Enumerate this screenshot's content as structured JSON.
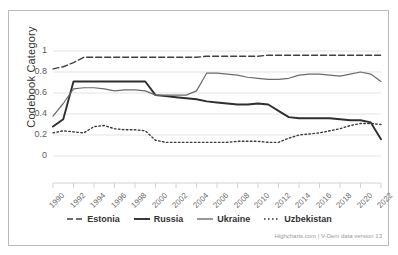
{
  "chart_data": {
    "type": "line",
    "title": "",
    "subtitle": "",
    "xlabel": "",
    "ylabel": "Codebook Category",
    "ylim": [
      0,
      1
    ],
    "xlim": [
      1990,
      2022
    ],
    "grid": true,
    "legend_position": "bottom",
    "credits": "Highcharts.com | V-Dem data version 13",
    "y_ticks": [
      "0",
      "0.2",
      "0.4",
      "0.6",
      "0.8",
      "1"
    ],
    "y_tick_values": [
      0,
      0.2,
      0.4,
      0.6,
      0.8,
      1
    ],
    "x_ticks": [
      "1990",
      "1992",
      "1994",
      "1996",
      "1998",
      "2000",
      "2002",
      "2004",
      "2006",
      "2008",
      "2010",
      "2012",
      "2014",
      "2016",
      "2018",
      "2020",
      "2022"
    ],
    "x": [
      1990,
      1991,
      1992,
      1993,
      1994,
      1995,
      1996,
      1997,
      1998,
      1999,
      2000,
      2001,
      2002,
      2003,
      2004,
      2005,
      2006,
      2007,
      2008,
      2009,
      2010,
      2011,
      2012,
      2013,
      2014,
      2015,
      2016,
      2017,
      2018,
      2019,
      2020,
      2021,
      2022
    ],
    "series": [
      {
        "name": "Estonia",
        "style": "dashed",
        "color": "#404040",
        "width": 1.4,
        "values": [
          0.83,
          0.85,
          0.89,
          0.94,
          0.94,
          0.94,
          0.94,
          0.94,
          0.94,
          0.94,
          0.94,
          0.94,
          0.94,
          0.94,
          0.94,
          0.95,
          0.95,
          0.95,
          0.95,
          0.95,
          0.95,
          0.96,
          0.96,
          0.96,
          0.96,
          0.96,
          0.96,
          0.96,
          0.96,
          0.96,
          0.96,
          0.96,
          0.96
        ]
      },
      {
        "name": "Russia",
        "style": "solid",
        "color": "#2f2f2f",
        "width": 1.9,
        "values": [
          0.28,
          0.35,
          0.71,
          0.71,
          0.71,
          0.71,
          0.71,
          0.71,
          0.71,
          0.71,
          0.58,
          0.57,
          0.56,
          0.55,
          0.54,
          0.52,
          0.51,
          0.5,
          0.49,
          0.49,
          0.5,
          0.49,
          0.43,
          0.37,
          0.36,
          0.36,
          0.36,
          0.36,
          0.35,
          0.34,
          0.34,
          0.32,
          0.16
        ]
      },
      {
        "name": "Ukraine",
        "style": "solid",
        "color": "#6b6b6b",
        "width": 1.2,
        "values": [
          0.38,
          0.5,
          0.64,
          0.65,
          0.65,
          0.64,
          0.62,
          0.63,
          0.63,
          0.62,
          0.58,
          0.58,
          0.58,
          0.58,
          0.62,
          0.79,
          0.79,
          0.78,
          0.77,
          0.75,
          0.74,
          0.73,
          0.73,
          0.74,
          0.77,
          0.78,
          0.78,
          0.77,
          0.76,
          0.78,
          0.8,
          0.78,
          0.71
        ]
      },
      {
        "name": "Uzbekistan",
        "style": "dotted",
        "color": "#3a3a3a",
        "width": 1.4,
        "values": [
          0.22,
          0.24,
          0.23,
          0.22,
          0.28,
          0.29,
          0.26,
          0.25,
          0.25,
          0.24,
          0.15,
          0.13,
          0.13,
          0.13,
          0.13,
          0.13,
          0.13,
          0.13,
          0.14,
          0.14,
          0.14,
          0.13,
          0.13,
          0.17,
          0.2,
          0.21,
          0.22,
          0.24,
          0.26,
          0.29,
          0.31,
          0.31,
          0.3
        ]
      }
    ]
  },
  "legend": {
    "items": [
      {
        "label": "Estonia"
      },
      {
        "label": "Russia"
      },
      {
        "label": "Ukraine"
      },
      {
        "label": "Uzbekistan"
      }
    ]
  },
  "credits": {
    "text": "Highcharts.com | V-Dem data version 13"
  }
}
